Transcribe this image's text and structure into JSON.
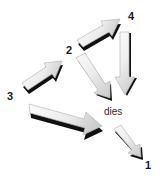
{
  "diagram": {
    "title": "dies",
    "background_color": "#ffffff",
    "arrow_fill_light": "#f2f2f2",
    "arrow_fill_dark": "#cfcfcf",
    "arrow_outline": "#b5b5b5",
    "arrow_shadow": "#111111",
    "label_color": "#1a1a1a",
    "labels": [
      {
        "id": "label-1",
        "text": "1",
        "x": 145,
        "y": 160
      },
      {
        "id": "label-2",
        "text": "2",
        "x": 66,
        "y": 45
      },
      {
        "id": "label-3",
        "text": "3",
        "x": 7,
        "y": 91
      },
      {
        "id": "label-4",
        "text": "4",
        "x": 128,
        "y": 11
      }
    ],
    "center_text": {
      "id": "center-label",
      "text": "dies",
      "x": 104,
      "y": 107
    },
    "arrows": [
      {
        "id": "arrow-up-right-to-4",
        "name": "arrow-to-label-4",
        "direction": "up-right",
        "from": [
          78,
          43
        ],
        "to": [
          122,
          17
        ]
      },
      {
        "id": "arrow-down-right-from-4",
        "name": "arrow-from-label-4-down",
        "direction": "down",
        "from": [
          125,
          32
        ],
        "to": [
          125,
          96
        ]
      },
      {
        "id": "arrow-up-right-from-3",
        "name": "arrow-from-label-3",
        "direction": "up-right",
        "from": [
          22,
          85
        ],
        "to": [
          63,
          57
        ]
      },
      {
        "id": "arrow-down-right-from-2",
        "name": "arrow-from-label-2",
        "direction": "down-right",
        "from": [
          76,
          57
        ],
        "to": [
          109,
          97
        ]
      },
      {
        "id": "arrow-big-right",
        "name": "arrow-main-right",
        "direction": "right-down",
        "from": [
          28,
          103
        ],
        "to": [
          101,
          126
        ]
      },
      {
        "id": "arrow-down-right-to-1",
        "name": "arrow-to-label-1",
        "direction": "down-right",
        "from": [
          114,
          128
        ],
        "to": [
          143,
          158
        ]
      }
    ]
  }
}
